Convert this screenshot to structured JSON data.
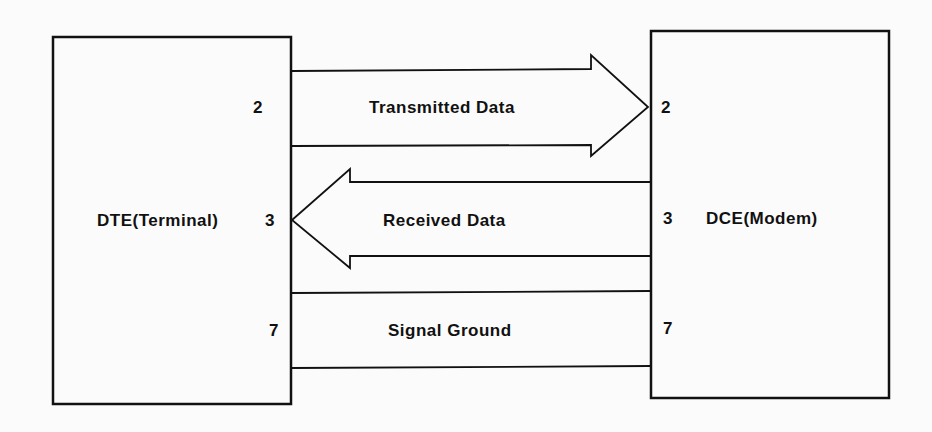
{
  "diagram": {
    "left_device": {
      "label": "DTE(Terminal)"
    },
    "right_device": {
      "label": "DCE(Modem)"
    },
    "signals": [
      {
        "name": "Transmitted Data",
        "left_pin": "2",
        "right_pin": "2",
        "direction": "DTE→DCE"
      },
      {
        "name": "Received Data",
        "left_pin": "3",
        "right_pin": "3",
        "direction": "DCE→DTE"
      },
      {
        "name": "Signal Ground",
        "left_pin": "7",
        "right_pin": "7",
        "direction": "none"
      }
    ],
    "colors": {
      "stroke": "#111111",
      "background": "#fbfbfb"
    }
  }
}
